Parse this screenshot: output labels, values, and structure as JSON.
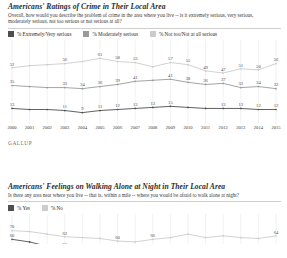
{
  "colors": {
    "series_dark": "#4f4f4f",
    "series_mid": "#9a9a9a",
    "series_light": "#cccccc",
    "grid": "#e2e2e2",
    "text": "#2d2d2d",
    "brand": "#6d6d6d"
  },
  "brand": {
    "label": "GALLUP"
  },
  "chart1": {
    "title": "Americans' Ratings of Crime in Their Local Area",
    "subtitle": "Overall, how would you describe the problem of crime in the area where you live -- is it extremely serious, very serious, moderately serious, not too serious or not serious at all?",
    "legend": [
      {
        "label": "% Extremely/Very serious",
        "color": "#4f4f4f"
      },
      {
        "label": "% Moderately serious",
        "color": "#9a9a9a"
      },
      {
        "label": "% Not too/Not at all serious",
        "color": "#cccccc"
      }
    ]
  },
  "chart2": {
    "title": "Americans' Feelings on Walking Alone at Night in Their Local Area",
    "subtitle": "Is there any area near where you live -- that is, within a mile -- where you would be afraid to walk alone at night?",
    "legend": [
      {
        "label": "% Yes",
        "color": "#4f4f4f"
      },
      {
        "label": "% No",
        "color": "#cccccc"
      }
    ]
  },
  "chart_data": [
    {
      "type": "line",
      "title": "Americans' Ratings of Crime in Their Local Area",
      "xlabel": "",
      "ylabel": "",
      "ylim": [
        0,
        70
      ],
      "grid": true,
      "legend_position": "top",
      "categories": [
        "2000",
        "2001",
        "2002",
        "2003",
        "2004",
        "2005",
        "2006",
        "2007",
        "2008",
        "2009",
        "2010",
        "2011",
        "2012",
        "2013",
        "2014",
        "2015"
      ],
      "series": [
        {
          "name": "% Moderately serious",
          "color": "#cccccc",
          "values": [
            52,
            54,
            55,
            56,
            58,
            61,
            58,
            57,
            53,
            57,
            55,
            49,
            47,
            51,
            50,
            56
          ],
          "labels": [
            "52",
            "",
            "",
            "56",
            "",
            "61",
            "58",
            "53",
            "",
            "57",
            "55",
            "49",
            "47",
            "51",
            "50",
            "56"
          ]
        },
        {
          "name": "% Extremely/Very serious",
          "color": "#9a9a9a",
          "values": [
            35,
            34,
            33,
            33,
            32,
            34,
            36,
            39,
            40,
            41,
            38,
            36,
            37,
            33,
            34,
            32
          ],
          "labels": [
            "35",
            "",
            "",
            "33",
            "34",
            "36",
            "39",
            "41",
            "",
            "41",
            "38",
            "36",
            "37",
            "33",
            "34",
            "32"
          ]
        },
        {
          "name": "% Not too/Not at all serious",
          "color": "#4f4f4f",
          "values": [
            13,
            12,
            12,
            11,
            9,
            11,
            12,
            13,
            14,
            15,
            14,
            13,
            13,
            13,
            12,
            12
          ],
          "labels": [
            "13",
            "",
            "",
            "11",
            "9",
            "11",
            "12",
            "13",
            "13",
            "15",
            "",
            "",
            "13",
            "13",
            "12",
            "12"
          ]
        }
      ]
    },
    {
      "type": "line",
      "title": "Americans' Feelings on Walking Alone at Night in Their Local Area",
      "xlabel": "",
      "ylabel": "",
      "ylim": [
        20,
        80
      ],
      "grid": true,
      "legend_position": "top",
      "categories": [
        "2000",
        "2001",
        "2002",
        "2003",
        "2004",
        "2005",
        "2006",
        "2007",
        "2008",
        "2009",
        "2010",
        "2011",
        "2012",
        "2013",
        "2014",
        "2015"
      ],
      "series": [
        {
          "name": "% No",
          "color": "#cccccc",
          "values": [
            70,
            69,
            66,
            63,
            62,
            61,
            58,
            57,
            60,
            62,
            66,
            62,
            64,
            62,
            61,
            64
          ],
          "labels": [
            "70",
            "",
            "",
            "62",
            "",
            "",
            "60",
            "",
            "66",
            "",
            "",
            "",
            "",
            "",
            "",
            "64"
          ]
        },
        {
          "name": "% Yes",
          "color": "#4f4f4f",
          "values": [
            60,
            57,
            52,
            50,
            48,
            45,
            40,
            37,
            37,
            38,
            39,
            38,
            37,
            37,
            36,
            38
          ],
          "labels": [
            "60",
            "",
            "",
            "50",
            "",
            "",
            "",
            "",
            "",
            "",
            "",
            "",
            "",
            "",
            "",
            ""
          ]
        }
      ]
    }
  ]
}
